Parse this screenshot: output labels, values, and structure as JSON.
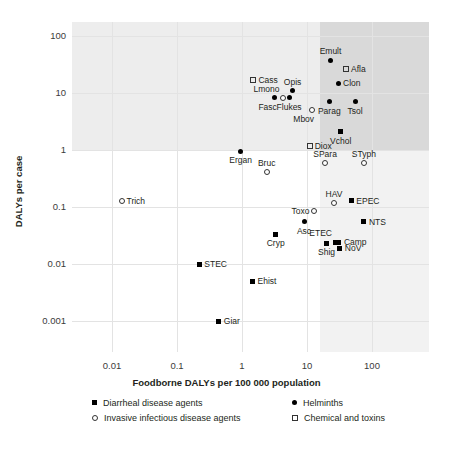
{
  "chart_data": {
    "type": "scatter",
    "title": "",
    "xlabel": "Foodborne DALYs per 100 000 population",
    "ylabel": "DALYs per case",
    "xscale": "log",
    "yscale": "log",
    "xlim": [
      0.004,
      300
    ],
    "ylim": [
      0.0004,
      300
    ],
    "xticks": [
      "0.01",
      "0.1",
      "1",
      "10",
      "100"
    ],
    "xtick_values": [
      0.01,
      0.1,
      1,
      10,
      100
    ],
    "yticks": [
      "100",
      "10",
      "1",
      "0.1",
      "0.01",
      "0.001"
    ],
    "ytick_values": [
      100,
      10,
      1,
      0.1,
      0.01,
      0.001
    ],
    "grid": true,
    "legend_position": "below-axis",
    "shaded_quadrants": {
      "x_threshold": 10,
      "y_threshold": 1,
      "note": "Background shading divides the plot at 10 DALYs per 100 000 population and 1 DALY per case"
    },
    "legend": [
      {
        "label": "Diarrheal disease agents",
        "marker": "square-filled"
      },
      {
        "label": "Helminths",
        "marker": "circle-filled"
      },
      {
        "label": "Invasive infectious disease agents",
        "marker": "circle-open"
      },
      {
        "label": "Chemical and toxins",
        "marker": "square-open"
      }
    ],
    "points": [
      {
        "label": "Emult",
        "x": 23,
        "y": 38,
        "marker": "circle-filled",
        "label_pos": "top"
      },
      {
        "label": "Afla",
        "x": 40,
        "y": 26,
        "marker": "square-open",
        "label_pos": "right"
      },
      {
        "label": "Cass",
        "x": 1.5,
        "y": 17,
        "marker": "square-open",
        "label_pos": "right"
      },
      {
        "label": "Clon",
        "x": 30,
        "y": 15,
        "marker": "circle-filled",
        "label_pos": "right"
      },
      {
        "label": "Opis",
        "x": 6.0,
        "y": 11,
        "marker": "circle-filled",
        "label_pos": "top"
      },
      {
        "label": "Lmono",
        "x": 4.2,
        "y": 8.3,
        "marker": "circle-open",
        "label_pos": "topleft"
      },
      {
        "label": "Fasc",
        "x": 3.2,
        "y": 8.3,
        "marker": "circle-filled",
        "label_pos": "bottomleft"
      },
      {
        "label": "Flukes",
        "x": 5.3,
        "y": 8.3,
        "marker": "circle-filled",
        "label_pos": "bottom"
      },
      {
        "label": "Parag",
        "x": 22,
        "y": 7.0,
        "marker": "circle-filled",
        "label_pos": "bottom"
      },
      {
        "label": "Tsol",
        "x": 55,
        "y": 7.0,
        "marker": "circle-filled",
        "label_pos": "bottom"
      },
      {
        "label": "Mbov",
        "x": 12,
        "y": 5.0,
        "marker": "circle-open",
        "label_pos": "bottomleft"
      },
      {
        "label": "Vchol",
        "x": 33,
        "y": 2.1,
        "marker": "square-filled",
        "label_pos": "bottom"
      },
      {
        "label": "Diox",
        "x": 11,
        "y": 1.2,
        "marker": "square-open",
        "label_pos": "right"
      },
      {
        "label": "Ergan",
        "x": 0.95,
        "y": 0.95,
        "marker": "circle-filled",
        "label_pos": "bottom"
      },
      {
        "label": "Bruc",
        "x": 2.4,
        "y": 0.42,
        "marker": "circle-open",
        "label_pos": "top"
      },
      {
        "label": "SPara",
        "x": 19,
        "y": 0.6,
        "marker": "circle-open",
        "label_pos": "top"
      },
      {
        "label": "STyph",
        "x": 75,
        "y": 0.6,
        "marker": "circle-open",
        "label_pos": "top"
      },
      {
        "label": "Trich",
        "x": 0.014,
        "y": 0.13,
        "marker": "circle-open",
        "label_pos": "right"
      },
      {
        "label": "HAV",
        "x": 26,
        "y": 0.12,
        "marker": "circle-open",
        "label_pos": "top"
      },
      {
        "label": "EPEC",
        "x": 48,
        "y": 0.13,
        "marker": "square-filled",
        "label_pos": "right"
      },
      {
        "label": "Toxo",
        "x": 13,
        "y": 0.085,
        "marker": "circle-open",
        "label_pos": "left"
      },
      {
        "label": "NTS",
        "x": 75,
        "y": 0.055,
        "marker": "square-filled",
        "label_pos": "right"
      },
      {
        "label": "Asc",
        "x": 9.0,
        "y": 0.055,
        "marker": "circle-filled",
        "label_pos": "bottom"
      },
      {
        "label": "Cryp",
        "x": 3.3,
        "y": 0.033,
        "marker": "square-filled",
        "label_pos": "bottom"
      },
      {
        "label": "ETEC",
        "x": 27,
        "y": 0.024,
        "marker": "square-filled",
        "label_pos": "topleft"
      },
      {
        "label": "Camp",
        "x": 31,
        "y": 0.024,
        "marker": "square-filled",
        "label_pos": "right"
      },
      {
        "label": "NoV",
        "x": 32,
        "y": 0.019,
        "marker": "square-filled",
        "label_pos": "right"
      },
      {
        "label": "Shig",
        "x": 20,
        "y": 0.023,
        "marker": "square-filled",
        "label_pos": "bottom"
      },
      {
        "label": "STEC",
        "x": 0.22,
        "y": 0.01,
        "marker": "square-filled",
        "label_pos": "right"
      },
      {
        "label": "Ehist",
        "x": 1.45,
        "y": 0.005,
        "marker": "square-filled",
        "label_pos": "right"
      },
      {
        "label": "Giar",
        "x": 0.44,
        "y": 0.001,
        "marker": "square-filled",
        "label_pos": "right"
      }
    ]
  }
}
